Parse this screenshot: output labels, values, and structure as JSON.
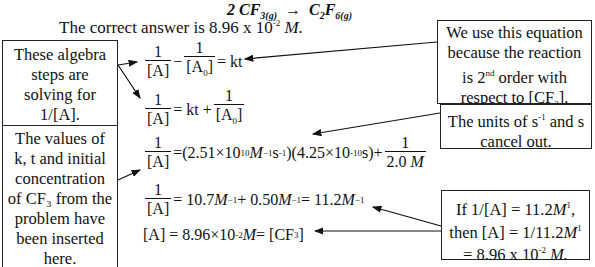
{
  "reaction": {
    "coef": "2 ",
    "reactant": "CF",
    "reactant_sub": "3(g)",
    "arrow": "→",
    "product": "C",
    "product_sub1": "2",
    "product_mid": "F",
    "product_sub2": "6(g)"
  },
  "answer": {
    "prefix": "The correct answer is 8.96 x 10",
    "exp": "-2",
    "unit": " M."
  },
  "boxes": {
    "algebra": "These algebra steps are solving for 1/[A].",
    "values": "The values of k, t and initial concentration of CF₃ from the problem have been inserted here.",
    "equation_lines": [
      "We use this equation",
      "because the reaction",
      "is 2",
      "nd",
      " order with",
      "respect to [CF",
      "3",
      "]."
    ],
    "units": {
      "pre": "The units of s",
      "exp": "-1",
      "post": " and s cancel out."
    },
    "final": {
      "l1a": "If 1/[A] = 11.2",
      "l1u": "M",
      "l1e": "1",
      "l1b": ",",
      "l2a": "then [A] = 1/11.2",
      "l2u": "M",
      "l2e": "1",
      "l3a": "= 8.96 x 10",
      "l3e": "-2",
      "l3u": " M."
    }
  },
  "equations": {
    "one": "1",
    "A": "[A]",
    "A0": "[A",
    "A0sub": "0",
    "A0end": "]",
    "kt": "= kt",
    "kt_plus": "= kt +",
    "minus": "−",
    "eq3": {
      "eqsign": "= ",
      "k": "(2.51×10",
      "k_exp": "10",
      "k_unit": " M",
      "k_unit_exp": "−1",
      "s": "s",
      "s_exp": "-1",
      "close": ")",
      "t": "(4.25×10",
      "t_exp": "-10",
      "t_unit": " s)+",
      "den": "2.0 ",
      "denM": "M"
    },
    "eq4": {
      "a": "= 10.7",
      "M1": "M",
      "e1": "−1",
      "b": " + 0.50 ",
      "M2": "M",
      "e2": "−1",
      "c": " = 11.2",
      "M3": "M",
      "e3": "−1"
    },
    "eq5": {
      "a": "[A] = 8.96×10",
      "e": "-2",
      "M": " M",
      "b": " = [CF",
      "sub": "3",
      "c": "]"
    }
  }
}
